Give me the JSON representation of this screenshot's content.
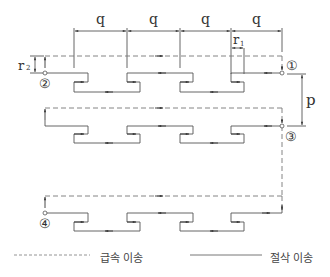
{
  "diagram": {
    "type": "toolpath",
    "colors": {
      "line": "#555555",
      "dashed": "#777777",
      "text": "#333333"
    },
    "dimensions": {
      "q_labels": [
        "q",
        "q",
        "q",
        "q"
      ],
      "r1": "r",
      "r1_sub": "1",
      "r2": "r",
      "r2_sub": "2",
      "p": "p"
    },
    "points": {
      "p1": "①",
      "p2": "②",
      "p3": "③",
      "p4": "④"
    }
  },
  "legend": {
    "rapid_label": "급속 이송",
    "cut_label": "절삭 이송"
  }
}
